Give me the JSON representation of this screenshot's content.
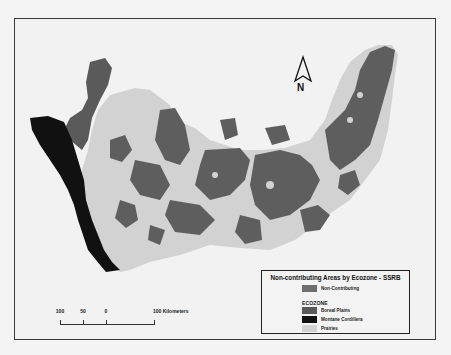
{
  "map": {
    "title": "Non-contributing Areas by Ecozone - SSRB",
    "north_arrow": {
      "label": "N",
      "icon": "north-arrow-icon"
    },
    "scale_bar": {
      "ticks": [
        "100",
        "50",
        "0",
        "100"
      ],
      "units": "100 Kilometers",
      "tick_label_0": "100",
      "tick_label_1": "50",
      "tick_label_2": "0"
    },
    "legend": {
      "title": "Non-contributing Areas by Ecozone - SSRB",
      "items": [
        {
          "label": "Non-Contributing",
          "color": "#6e6e6e"
        },
        {
          "label": "Boreal Plains",
          "color": "#5a5a5a"
        },
        {
          "label": "Montane Cordillera",
          "color": "#111111"
        },
        {
          "label": "Prairies",
          "color": "#d2d2d2"
        }
      ],
      "ecozone_heading": "ECOZONE"
    },
    "colors": {
      "background": "#f2f2f2",
      "non_contributing": "#5c5c5c",
      "boreal_plains": "#5a5a5a",
      "montane_cordillera": "#111111",
      "prairies": "#d2d2d2",
      "frame": "#3a3a3a"
    }
  }
}
